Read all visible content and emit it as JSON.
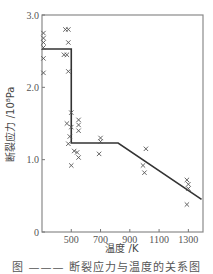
{
  "chart_data": {
    "type": "scatter",
    "title": "",
    "xlabel": "温度 /K",
    "ylabel": "断裂应力 /10⁸Pa",
    "xlim": [
      300,
      1400
    ],
    "ylim": [
      0,
      3.0
    ],
    "x_ticks": [
      500,
      700,
      900,
      1100,
      1300
    ],
    "x_tick_labels": [
      "500",
      "700",
      "900",
      "1100",
      "1300"
    ],
    "y_ticks": [
      0,
      1.0,
      2.0,
      3.0
    ],
    "y_tick_labels": [
      "0",
      "1.0",
      "2.0",
      "3.0"
    ],
    "grid": false,
    "series": [
      {
        "name": "measured",
        "marker": "x",
        "points": [
          [
            310,
            2.75
          ],
          [
            310,
            2.68
          ],
          [
            310,
            2.62
          ],
          [
            310,
            2.55
          ],
          [
            310,
            2.4
          ],
          [
            310,
            2.2
          ],
          [
            460,
            2.8
          ],
          [
            480,
            2.8
          ],
          [
            480,
            2.62
          ],
          [
            450,
            2.45
          ],
          [
            470,
            2.45
          ],
          [
            480,
            2.22
          ],
          [
            500,
            1.65
          ],
          [
            470,
            1.5
          ],
          [
            500,
            1.45
          ],
          [
            550,
            1.55
          ],
          [
            550,
            1.48
          ],
          [
            550,
            1.4
          ],
          [
            490,
            1.32
          ],
          [
            480,
            1.22
          ],
          [
            520,
            1.12
          ],
          [
            540,
            1.1
          ],
          [
            550,
            1.03
          ],
          [
            500,
            0.92
          ],
          [
            700,
            1.3
          ],
          [
            700,
            1.25
          ],
          [
            690,
            1.08
          ],
          [
            1010,
            1.15
          ],
          [
            990,
            0.92
          ],
          [
            1000,
            0.82
          ],
          [
            1290,
            0.72
          ],
          [
            1300,
            0.66
          ],
          [
            1300,
            0.6
          ],
          [
            1290,
            0.38
          ]
        ]
      },
      {
        "name": "trend",
        "marker": "line",
        "points": [
          [
            300,
            2.53
          ],
          [
            500,
            2.53
          ],
          [
            500,
            1.23
          ],
          [
            820,
            1.23
          ],
          [
            1390,
            0.45
          ]
        ]
      }
    ]
  },
  "caption": "图 ——— 断裂应力与温度的关系图"
}
